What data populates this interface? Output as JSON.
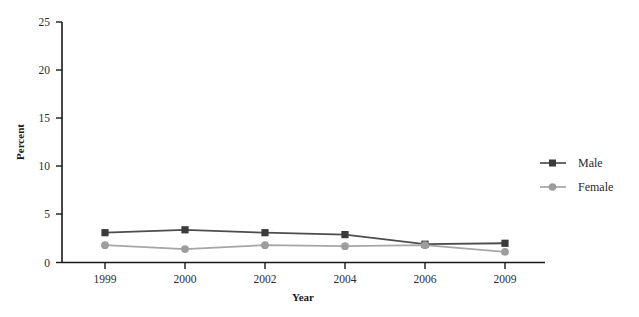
{
  "chart_data": {
    "type": "line",
    "title": "",
    "subtitle": "",
    "xlabel": "Year",
    "ylabel": "Percent",
    "categories": [
      "1999",
      "2000",
      "2002",
      "2004",
      "2006",
      "2009"
    ],
    "series": [
      {
        "name": "Male",
        "values": [
          3.1,
          3.4,
          3.1,
          2.9,
          1.9,
          2.0
        ],
        "color": "#4d4d4d",
        "marker": "square"
      },
      {
        "name": "Female",
        "values": [
          1.8,
          1.4,
          1.8,
          1.7,
          1.8,
          1.1
        ],
        "color": "#a6a6a6",
        "marker": "circle"
      }
    ],
    "ylim": [
      0,
      25
    ],
    "yticks": [
      0,
      5,
      10,
      15,
      20,
      25
    ],
    "ytick_labels": [
      "0",
      "5",
      "10",
      "15",
      "20",
      "25"
    ],
    "xtick_labels": [
      "1999",
      "2000",
      "2002",
      "2004",
      "2006",
      "2009"
    ],
    "grid": false,
    "legend_position": "right",
    "legend_entries": [
      "Male",
      "Female"
    ],
    "axis_color": "#1a1a1a",
    "background": "#ffffff"
  },
  "axes": {
    "y_title": "Percent",
    "x_title": "Year",
    "y_ticks": [
      {
        "label": "25",
        "value": 25
      },
      {
        "label": "20",
        "value": 20
      },
      {
        "label": "15",
        "value": 15
      },
      {
        "label": "10",
        "value": 10
      },
      {
        "label": "5",
        "value": 5
      },
      {
        "label": "0",
        "value": 0
      }
    ],
    "x_ticks": [
      {
        "label": "1999"
      },
      {
        "label": "2000"
      },
      {
        "label": "2002"
      },
      {
        "label": "2004"
      },
      {
        "label": "2006"
      },
      {
        "label": "2009"
      }
    ]
  },
  "legend": {
    "items": [
      {
        "label": "Male",
        "color": "#4d4d4d",
        "marker": "square"
      },
      {
        "label": "Female",
        "color": "#a6a6a6",
        "marker": "circle"
      }
    ]
  }
}
